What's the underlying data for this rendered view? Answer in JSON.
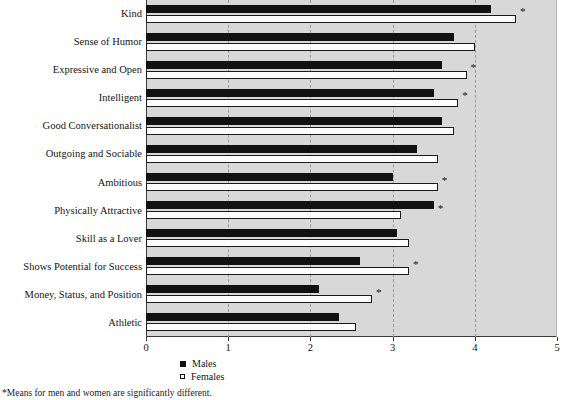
{
  "chart_data": {
    "type": "bar",
    "orientation": "horizontal",
    "title": "",
    "subtitle": "",
    "xlabel": "",
    "ylabel": "",
    "xlim": [
      0,
      5
    ],
    "xticks": [
      0,
      1,
      2,
      3,
      4,
      5
    ],
    "xticklabels": [
      "0",
      "1",
      "2",
      "3",
      "4",
      "5"
    ],
    "grid": "vertical-dashed-at-integers",
    "legend_position": "bottom-left",
    "categories": [
      "Kind",
      "Sense of Humor",
      "Expressive and Open",
      "Intelligent",
      "Good Conversationalist",
      "Outgoing and Sociable",
      "Ambitious",
      "Physically Attractive",
      "Skill as a Lover",
      "Shows Potential for Success",
      "Money, Status, and Position",
      "Athletic"
    ],
    "series": [
      {
        "name": "Males",
        "color": "#111111",
        "style": "filled",
        "values": [
          4.2,
          3.75,
          3.6,
          3.5,
          3.6,
          3.3,
          3.0,
          3.5,
          3.05,
          2.6,
          2.1,
          2.35
        ]
      },
      {
        "name": "Females",
        "color": "#ffffff",
        "style": "open-outlined",
        "values": [
          4.5,
          4.0,
          3.9,
          3.8,
          3.75,
          3.55,
          3.55,
          3.1,
          3.2,
          3.2,
          2.75,
          2.55
        ]
      }
    ],
    "significance_marker": "*",
    "significant_categories": [
      "Kind",
      "Expressive and Open",
      "Intelligent",
      "Ambitious",
      "Physically Attractive",
      "Shows Potential for Success",
      "Money, Status, and Position"
    ],
    "annotations": {
      "footnote": "*Means for men and women are significantly different."
    },
    "colors": {
      "plot_background": "#d8d8d8",
      "page_background": "#ffffff",
      "axis": "#3a3a3a",
      "gridline": "#9a9a9a",
      "males": "#111111",
      "females": "#ffffff"
    }
  },
  "legend": {
    "items": [
      {
        "label": "Males",
        "marker": "filled-square-icon"
      },
      {
        "label": "Females",
        "marker": "open-square-icon"
      }
    ]
  },
  "footnote": {
    "text": "*Means for men and women are significantly different."
  }
}
